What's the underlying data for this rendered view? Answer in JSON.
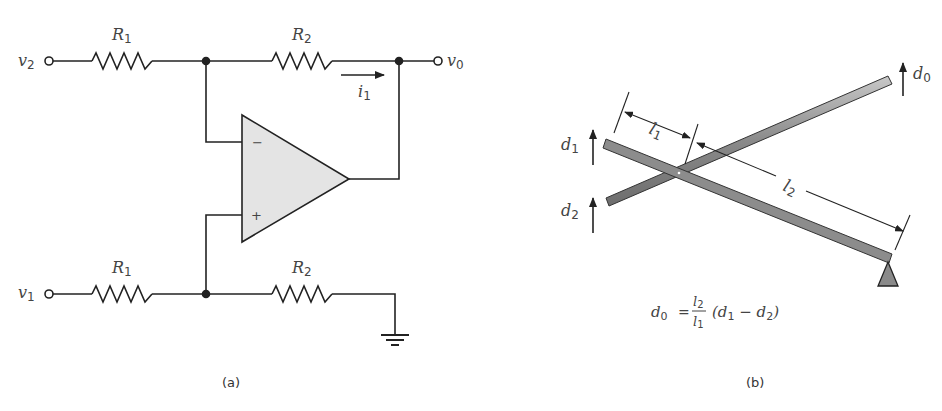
{
  "panel_a": {
    "caption": "(a)",
    "labels": {
      "v2": "v",
      "v2_sub": "2",
      "v1": "v",
      "v1_sub": "1",
      "v0": "v",
      "v0_sub": "0",
      "r1_top": "R",
      "r1_top_sub": "1",
      "r2_top": "R",
      "r2_top_sub": "2",
      "r1_bot": "R",
      "r1_bot_sub": "1",
      "r2_bot": "R",
      "r2_bot_sub": "2",
      "i1": "i",
      "i1_sub": "1",
      "minus": "−",
      "plus": "+"
    }
  },
  "panel_b": {
    "caption": "(b)",
    "labels": {
      "d0": "d",
      "d0_sub": "0",
      "d1": "d",
      "d1_sub": "1",
      "d2": "d",
      "d2_sub": "2",
      "l1": "l",
      "l1_sub": "1",
      "l2": "l",
      "l2_sub": "2"
    },
    "equation": {
      "lhs": "d",
      "lhs_sub": "0",
      "eq": "=",
      "num": "l",
      "num_sub": "2",
      "den": "l",
      "den_sub": "1",
      "rhs_open": "(d",
      "rhs_a_sub": "1",
      "rhs_minus": " − d",
      "rhs_b_sub": "2",
      "rhs_close": ")"
    }
  },
  "colors": {
    "wire": "#222222",
    "opamp_fill": "#e4e4e4",
    "bar_fill": "#8a8a8a",
    "bar_light": "#b5b5b5",
    "label": "#444444"
  }
}
